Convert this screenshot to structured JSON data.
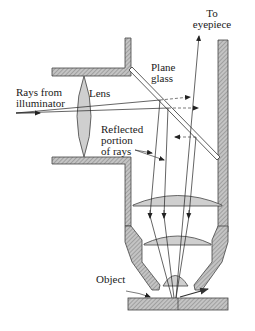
{
  "diagram": {
    "labels": {
      "to_eyepiece_line1": "To",
      "to_eyepiece_line2": "eyepiece",
      "plane_glass_line1": "Plane",
      "plane_glass_line2": "glass",
      "rays_line1": "Rays from",
      "rays_line2": "illuminator",
      "lens": "Lens",
      "reflected_line1": "Reflected",
      "reflected_line2": "portion",
      "reflected_line3": "of rays",
      "object": "Object"
    },
    "colors": {
      "hatch_fill": "#b8b8b8",
      "lens_fill": "#d0d0d0",
      "stroke": "#333333",
      "background": "#ffffff"
    }
  }
}
